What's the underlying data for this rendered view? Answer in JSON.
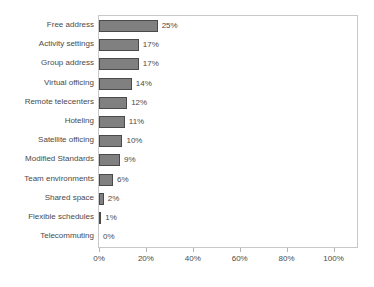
{
  "chart_data": {
    "type": "bar",
    "orientation": "horizontal",
    "title": "",
    "xlabel": "",
    "ylabel": "",
    "xlim": [
      0,
      110
    ],
    "xticks": [
      "0%",
      "20%",
      "40%",
      "60%",
      "80%",
      "100%"
    ],
    "xtick_values": [
      0,
      20,
      40,
      60,
      80,
      100
    ],
    "grid": false,
    "legend": "none",
    "categories": [
      "Free address",
      "Activity settings",
      "Group address",
      "Virtual officing",
      "Remote telecenters",
      "Hoteling",
      "Satellite officing",
      "Modified Standards",
      "Team environments",
      "Shared space",
      "Flexible schedules",
      "Telecommuting"
    ],
    "values": [
      25,
      17,
      17,
      14,
      12,
      11,
      10,
      9,
      6,
      2,
      1,
      0
    ],
    "value_labels": [
      "25%",
      "17%",
      "17%",
      "14%",
      "12%",
      "11%",
      "10%",
      "9%",
      "6%",
      "2%",
      "1%",
      "0%"
    ],
    "bar_fill_color": "#808080",
    "bar_border_color": "#4a4a4a",
    "plot_border_color": "#c8c8c8",
    "text_color": "#4a4a4a",
    "background_color": "#ffffff"
  },
  "artifacts": {
    "top_edge_sliver": "."
  }
}
